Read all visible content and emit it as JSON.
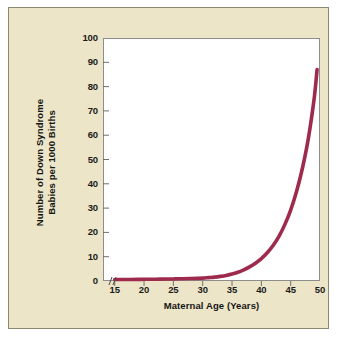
{
  "figure": {
    "panel_background": "#ece5c8",
    "panel_border": "#8b8870",
    "plot_background": "#ffffff",
    "plot_border": "#8d8d8d",
    "curve_color": "#9e2b4e",
    "text_color": "#151515"
  },
  "chart_data": {
    "type": "line",
    "title": "",
    "subtitle": "",
    "xlabel": "Maternal Age (Years)",
    "ylabel": "Number of Down Syndrome Babies per 1000 Births",
    "ylabel_line1": "Number of Down Syndrome",
    "ylabel_line2": "Babies per 1000 Births",
    "xlim": [
      13,
      50
    ],
    "ylim": [
      0,
      100
    ],
    "xticks": [
      15,
      20,
      25,
      30,
      35,
      40,
      45,
      50
    ],
    "yticks": [
      0,
      10,
      20,
      30,
      40,
      50,
      60,
      70,
      80,
      90,
      100
    ],
    "xtick_labels": [
      "15",
      "20",
      "25",
      "30",
      "35",
      "40",
      "45",
      "50"
    ],
    "ytick_labels": [
      "0",
      "10",
      "20",
      "30",
      "40",
      "50",
      "60",
      "70",
      "80",
      "90",
      "100"
    ],
    "grid": false,
    "legend": false,
    "axis_break_x": true,
    "series": [
      {
        "name": "Down syndrome incidence",
        "line_color": "#9e2b4e",
        "line_width": 3.6,
        "x": [
          15,
          17,
          19,
          20,
          22,
          24,
          25,
          26,
          28,
          30,
          31,
          32,
          33,
          34,
          35,
          36,
          37,
          38,
          39,
          40,
          41,
          42,
          43,
          44,
          45,
          46,
          47,
          48,
          49,
          49.5
        ],
        "y": [
          0.6,
          0.6,
          0.65,
          0.7,
          0.75,
          0.8,
          0.85,
          0.9,
          1.0,
          1.2,
          1.4,
          1.6,
          1.9,
          2.3,
          2.9,
          3.6,
          4.6,
          5.8,
          7.3,
          9.2,
          11.6,
          14.6,
          18.4,
          23.2,
          29.2,
          36.8,
          46.4,
          58.5,
          75.0,
          87.0
        ]
      }
    ]
  }
}
